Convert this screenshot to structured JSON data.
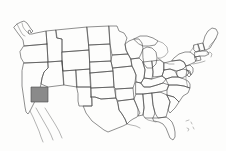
{
  "map": {
    "title": "United States state locator map",
    "type": "choropleth-locator",
    "width": 226,
    "height": 151,
    "background_color": "#fdfdfc",
    "outline_color": "#4a4a4a",
    "highlight_color": "#8a8a8a",
    "has_labels": false,
    "has_legend": false,
    "has_title_text": false,
    "highlighted_states": [
      {
        "name": "Arizona",
        "abbr": "AZ",
        "fill": "#8a8a8a",
        "bbox": {
          "x": 31,
          "y": 87,
          "width": 17,
          "height": 15
        }
      }
    ],
    "unhighlighted_fill": "none",
    "features": [
      "lower-48-state-boundaries",
      "puget-sound",
      "great-lakes",
      "michigan-peninsulas",
      "florida-peninsula",
      "long-island",
      "cape-cod",
      "chesapeake-bay",
      "baja-california-tail",
      "bahamas-specks"
    ]
  }
}
